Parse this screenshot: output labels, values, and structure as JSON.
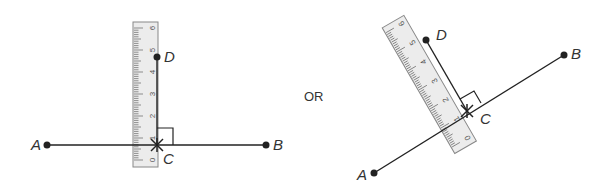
{
  "colors": {
    "line": "#222222",
    "ruler_fill": "#ececec",
    "ruler_stroke": "#888888",
    "tick": "#666666",
    "label": "#333333"
  },
  "separator_text": "OR",
  "left_figure": {
    "labels": {
      "A": "A",
      "B": "B",
      "C": "C",
      "D": "D"
    },
    "ruler_numbers": [
      "0",
      "1",
      "2",
      "3",
      "4",
      "5",
      "6"
    ]
  },
  "right_figure": {
    "labels": {
      "A": "A",
      "B": "B",
      "C": "C",
      "D": "D"
    },
    "ruler_numbers": [
      "0",
      "1",
      "2",
      "3",
      "4",
      "5",
      "6"
    ]
  }
}
